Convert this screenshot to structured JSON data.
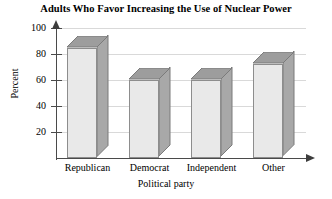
{
  "chart_data": {
    "type": "bar",
    "title": "Adults Who Favor Increasing the Use of Nuclear Power",
    "xlabel": "Political party",
    "ylabel": "Percent",
    "categories": [
      "Republican",
      "Democrat",
      "Independent",
      "Other"
    ],
    "values": [
      85,
      60,
      60,
      72
    ],
    "ylim": [
      0,
      100
    ],
    "yticks": [
      20,
      40,
      60,
      80,
      100
    ],
    "ytick_labels": [
      "20",
      "40",
      "60",
      "80",
      "100"
    ],
    "grid": true,
    "legend": null,
    "style": {
      "bar_front_color": "#e9e9e9",
      "bar_side_color": "#a8a8a8",
      "bar_top_color": "#9d9d9d",
      "bar_outline_color": "#8d8d8d",
      "gridline_color": "#d9d9d9",
      "axis_color": "#4a4a4a",
      "background_color": "#ffffff",
      "text_color": "#000000"
    }
  }
}
